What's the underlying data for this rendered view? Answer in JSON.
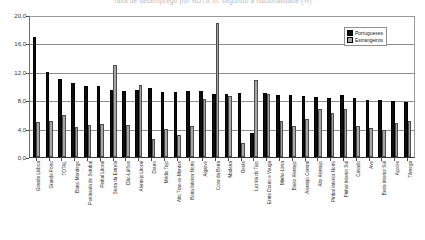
{
  "title_strip": "Taxa de desemprego por NUTS III, segundo a nacionalidade (%)",
  "legend": {
    "position": "top-right",
    "entries": [
      {
        "name": "Portugueses",
        "color": "#0d0d0d",
        "icon": "series-swatch-portugueses"
      },
      {
        "name": "Estrangeiros",
        "color": "#a6a6a6",
        "icon": "series-swatch-estrangeiros"
      }
    ]
  },
  "chart_data": {
    "type": "bar",
    "title": "Taxa de desemprego por NUTS III, segundo a nacionalidade (%)",
    "xlabel": "",
    "ylabel": "",
    "ylim": [
      0.0,
      20.0
    ],
    "ytick_values": [
      0.0,
      4.0,
      8.0,
      12.0,
      16.0,
      20.0
    ],
    "ytick_labels": [
      "0,0",
      "4,0",
      "8,0",
      "12,0",
      "16,0",
      "20,0"
    ],
    "grid": true,
    "grid_axis": "y",
    "legend_position": "top-right",
    "decimal_separator": ",",
    "categories": [
      "Grande Lisboa",
      "Grande Porto",
      "TOTAL",
      "Baixo Mondego",
      "Península de Setúbal",
      "Pinhal Litoral",
      "Serra da Estrela",
      "Dão-Lafões",
      "Alentejo Litoral",
      "Douro",
      "Médio Tejo",
      "Alto Trás-os-Montes",
      "Beira Interior Norte",
      "Algarve",
      "Cova da Beira",
      "Madeira",
      "Oeste",
      "Lezíria do Tejo",
      "Entre Douro e Vouga",
      "Minho-Lima",
      "Baixo Alentejo",
      "Alentejo Central",
      "Alto Alentejo",
      "Pinhal Interior Norte",
      "Pinhal Interior Sul",
      "Cávado",
      "Ave",
      "Beira Interior Sul",
      "Açores",
      "Tâmega"
    ],
    "series": [
      {
        "name": "Portugueses",
        "color": "#0d0d0d",
        "values": [
          17.1,
          12.2,
          11.1,
          10.6,
          10.2,
          10.1,
          9.6,
          9.5,
          9.6,
          9.9,
          9.3,
          9.3,
          9.5,
          9.4,
          9.0,
          9.0,
          9.2,
          3.5,
          9.1,
          8.9,
          8.8,
          8.7,
          8.6,
          8.5,
          8.8,
          8.4,
          8.2,
          8.1,
          8.0,
          7.9
        ]
      },
      {
        "name": "Estrangeiros",
        "color": "#a6a6a6",
        "values": [
          5.0,
          5.1,
          6.0,
          4.3,
          4.6,
          4.7,
          13.2,
          4.6,
          10.3,
          2.6,
          4.0,
          3.2,
          4.5,
          8.3,
          19.2,
          8.7,
          2.0,
          11.0,
          9.0,
          5.2,
          4.4,
          5.5,
          6.9,
          6.3,
          6.8,
          4.4,
          4.2,
          3.9,
          4.8,
          5.1
        ]
      }
    ]
  }
}
